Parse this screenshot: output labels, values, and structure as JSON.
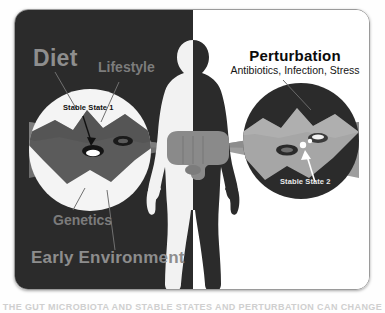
{
  "figure": {
    "title_left_primary": "Diet",
    "left_labels": [
      {
        "id": "diet",
        "text": "Diet"
      },
      {
        "id": "lifestyle",
        "text": "Lifestyle"
      },
      {
        "id": "genetics",
        "text": "Genetics"
      },
      {
        "id": "early-environment",
        "text": "Early Environment"
      }
    ],
    "right_heading": "Perturbation",
    "right_subheading": "Antibiotics, Infection, Stress",
    "annotations": [
      {
        "id": "stable-state-1",
        "text": "Stable State 1"
      },
      {
        "id": "stable-state-2",
        "text": "Stable State 2"
      }
    ],
    "caption_partial": "THE GUT MICROBIOTA AND STABLE STATES AND PERTURBATION CAN CHANGE THE",
    "colors": {
      "panel_dark": "#2b2b2b",
      "panel_light": "#ffffff",
      "label_gray": "#8e8e8e",
      "landscape_dark": "#5e5e5e",
      "landscape_light": "#a8a8a8",
      "cone_gray": "#7d7d7d",
      "gut_gray": "#8a8a8a",
      "frame_border": "#9a9a9a",
      "well_dark": "#1c1c1c",
      "arrow_white": "#ffffff",
      "arrow_dark": "#141414"
    }
  }
}
